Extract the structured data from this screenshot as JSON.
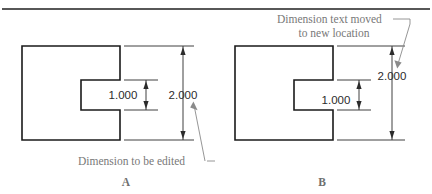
{
  "figure": {
    "title_rule": "horizontal-divider",
    "panels": [
      {
        "id": "panel-a",
        "label": "A",
        "caption": "Dimension to be edited",
        "dimensions": [
          {
            "name": "slot-height",
            "value": "1.000"
          },
          {
            "name": "overall-height",
            "value": "2.000"
          }
        ]
      },
      {
        "id": "panel-b",
        "label": "B",
        "caption_line1": "Dimension text moved",
        "caption_line2": "to new location",
        "dimensions": [
          {
            "name": "slot-height",
            "value": "1.000"
          },
          {
            "name": "overall-height",
            "value": "2.000"
          }
        ]
      }
    ]
  },
  "colors": {
    "outline": "#1a1a1a",
    "dimension": "#2b2b2b",
    "annotation": "#787878",
    "label": "#6f6f6f",
    "background": "#ffffff"
  }
}
